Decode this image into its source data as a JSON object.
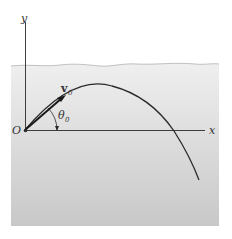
{
  "diagram": {
    "labels": {
      "y_axis": "y",
      "x_axis": "x",
      "origin": "O",
      "velocity": "v",
      "velocity_sub": "0",
      "angle": "θ",
      "angle_sub": "0"
    },
    "colors": {
      "background": "#ffffff",
      "region_top": "#ececec",
      "region_bottom": "#c9c9c9",
      "line": "#2a2a2a",
      "text": "#333333"
    }
  }
}
